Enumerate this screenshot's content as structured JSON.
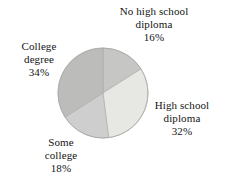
{
  "chart_data": {
    "type": "pie",
    "title": "",
    "subtitle": "",
    "xlabel": "",
    "ylabel": "",
    "legend_position": "none",
    "grid": false,
    "start_angle_deg": 0,
    "direction": "clockwise",
    "categories": [
      "No high school diploma",
      "High school diploma",
      "Some college",
      "College degree"
    ],
    "values": [
      16,
      32,
      18,
      34
    ],
    "value_unit": "%",
    "slices": [
      {
        "label_line1": "No high school",
        "label_line2": "diploma",
        "name": "No high school diploma",
        "value": 16,
        "value_text": "16%",
        "color": "#c6c6c4",
        "position": "top"
      },
      {
        "label_line1": "High school",
        "label_line2": "diploma",
        "name": "High school diploma",
        "value": 32,
        "value_text": "32%",
        "color": "#e7e7e3",
        "position": "right"
      },
      {
        "label_line1": "Some",
        "label_line2": "college",
        "name": "Some college",
        "value": 18,
        "value_text": "18%",
        "color": "#cecece",
        "position": "bottom-left"
      },
      {
        "label_line1": "College",
        "label_line2": "degree",
        "name": "College degree",
        "value": 34,
        "value_text": "34%",
        "color": "#bcbcba",
        "position": "left"
      }
    ],
    "geometry": {
      "center_x": 103,
      "center_y": 93,
      "radius": 45
    },
    "stroke_color": "#a9a9a7"
  }
}
